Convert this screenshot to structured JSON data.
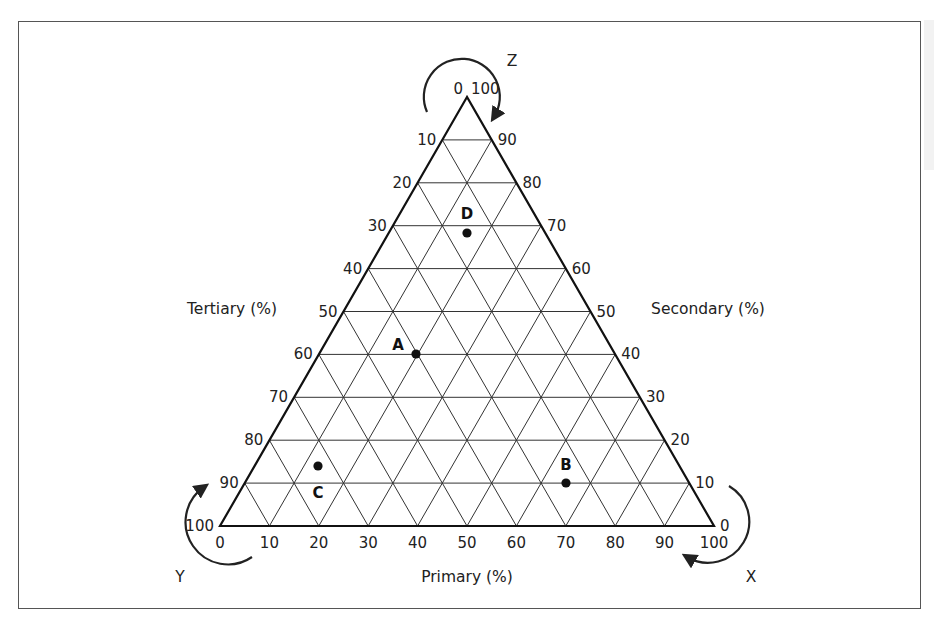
{
  "diagram": {
    "type": "ternary-plot",
    "axes": {
      "bottom": {
        "title": "Primary (%)",
        "ticks": [
          "0",
          "10",
          "20",
          "30",
          "40",
          "50",
          "60",
          "70",
          "80",
          "90",
          "100"
        ]
      },
      "left": {
        "title": "Tertiary (%)",
        "ticks": [
          "0",
          "10",
          "20",
          "30",
          "40",
          "50",
          "60",
          "70",
          "80",
          "90",
          "100"
        ]
      },
      "right": {
        "title": "Secondary (%)",
        "ticks": [
          "100",
          "90",
          "80",
          "70",
          "60",
          "50",
          "40",
          "30",
          "20",
          "10",
          "0"
        ]
      }
    },
    "corner_labels": {
      "top": "Z",
      "bottom_left": "Y",
      "bottom_right": "X"
    },
    "points": [
      {
        "label": "A",
        "level": 6,
        "x_frac": 0.4
      },
      {
        "label": "B",
        "level": 9,
        "x_frac": 0.7
      },
      {
        "label": "C",
        "level": 8.6,
        "x_frac": 0.2
      },
      {
        "label": "D",
        "level": 3.2,
        "x_frac": 0.5
      }
    ]
  },
  "chart_data": {
    "type": "ternary",
    "title": "",
    "axis_labels": {
      "bottom": "Primary (%)",
      "left": "Tertiary (%)",
      "right": "Secondary (%)"
    },
    "corners": {
      "top": "Z",
      "bottom_left": "Y",
      "bottom_right": "X"
    },
    "grid_step": 10,
    "range": [
      0,
      100
    ],
    "points": [
      {
        "name": "A",
        "primary": 40,
        "secondary": 0,
        "tertiary": 60
      },
      {
        "name": "B",
        "primary": 70,
        "secondary": 10,
        "tertiary": 20
      },
      {
        "name": "C",
        "primary": 20,
        "secondary": 14,
        "tertiary": 66
      },
      {
        "name": "D",
        "primary": 50,
        "secondary": 68,
        "tertiary": 0
      }
    ]
  }
}
